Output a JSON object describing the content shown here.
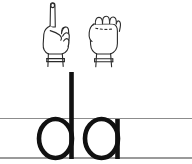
{
  "card": {
    "title": "Sign language alphabet handwriting card",
    "background_color": "#ffffff",
    "ink_color": "#111111",
    "rule_color": "#8c8c8c"
  },
  "hand_signs": [
    {
      "name": "hand-sign-d",
      "letter": "d",
      "description": "Index finger pointing up, remaining fingers curled against thumb, wrist cuff at base",
      "alt": "Sign language handshape for the letter d"
    },
    {
      "name": "hand-sign-a",
      "letter": "a",
      "description": "Closed fist with thumb alongside the index finger, wrist cuff at base",
      "alt": "Sign language handshape for the letter a"
    }
  ],
  "letters": [
    {
      "name": "letter-d",
      "character": "d",
      "style": "lowercase with tall ascender"
    },
    {
      "name": "letter-a",
      "character": "a",
      "style": "lowercase single-storey"
    }
  ],
  "guide_lines": [
    {
      "name": "midline",
      "label": "x-height line"
    },
    {
      "name": "baseline",
      "label": "baseline"
    }
  ]
}
